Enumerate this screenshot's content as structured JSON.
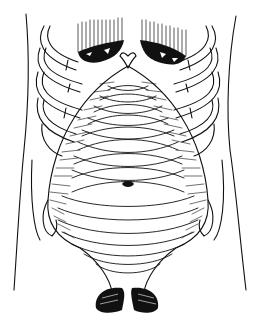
{
  "figure": {
    "colors": {
      "ink": "#111111",
      "paper": "#ffffff"
    },
    "labels": []
  }
}
